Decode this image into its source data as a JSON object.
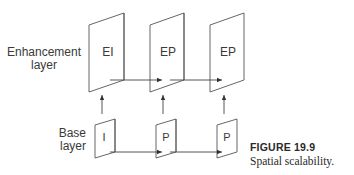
{
  "diagram": {
    "layers": {
      "enhancement_label_line1": "Enhancement",
      "enhancement_label_line2": "layer",
      "base_label_line1": "Base",
      "base_label_line2": "layer"
    },
    "enhancement_frames": [
      {
        "label": "EI"
      },
      {
        "label": "EP"
      },
      {
        "label": "EP"
      }
    ],
    "base_frames": [
      {
        "label": "I"
      },
      {
        "label": "P"
      },
      {
        "label": "P"
      }
    ],
    "edges": [
      {
        "from": "EI",
        "to": "EP1",
        "type": "horizontal-arrow"
      },
      {
        "from": "EP1",
        "to": "EP2",
        "type": "horizontal-arrow"
      },
      {
        "from": "I",
        "to": "P1",
        "type": "horizontal-arrow"
      },
      {
        "from": "P1",
        "to": "P2",
        "type": "horizontal-arrow"
      },
      {
        "from": "I",
        "to": "EI",
        "type": "vertical-arrow"
      },
      {
        "from": "P1",
        "to": "EP1",
        "type": "vertical-arrow"
      },
      {
        "from": "P2",
        "to": "EP2",
        "type": "vertical-arrow"
      }
    ],
    "colors": {
      "line": "#555555",
      "text": "#3a3a3a"
    }
  },
  "caption": {
    "title": "FIGURE 19.9",
    "text": "Spatial scalability."
  }
}
